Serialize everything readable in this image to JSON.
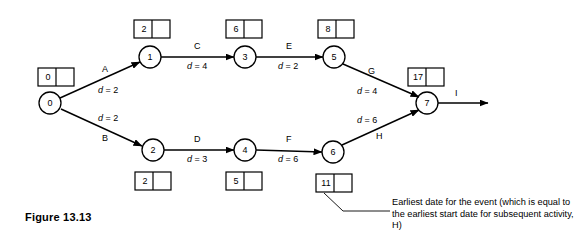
{
  "figure": {
    "caption": "Figure 13.13",
    "annotation": "Earliest date for the event  (which is equal to the earliest start date for subsequent activity, H)"
  },
  "chart_data": {
    "type": "diagram",
    "title": "Figure 13.13",
    "diagram_kind": "activity-on-arrow network / PERT chart",
    "nodes": [
      {
        "id": "0",
        "label": "0",
        "x": 50,
        "y": 103,
        "earliest_date": "0",
        "latest_date": "",
        "box_x": 38,
        "box_y": 68
      },
      {
        "id": "1",
        "label": "1",
        "x": 150,
        "y": 57,
        "earliest_date": "2",
        "latest_date": "",
        "box_x": 134,
        "box_y": 20
      },
      {
        "id": "2",
        "label": "2",
        "x": 153,
        "y": 150,
        "earliest_date": "2",
        "latest_date": "",
        "box_x": 135,
        "box_y": 172
      },
      {
        "id": "3",
        "label": "3",
        "x": 245,
        "y": 57,
        "earliest_date": "6",
        "latest_date": "",
        "box_x": 226,
        "box_y": 20
      },
      {
        "id": "4",
        "label": "4",
        "x": 245,
        "y": 150,
        "earliest_date": "5",
        "latest_date": "",
        "box_x": 226,
        "box_y": 172
      },
      {
        "id": "5",
        "label": "5",
        "x": 334,
        "y": 57,
        "earliest_date": "8",
        "latest_date": "",
        "box_x": 318,
        "box_y": 20
      },
      {
        "id": "6",
        "label": "6",
        "x": 333,
        "y": 152,
        "earliest_date": "11",
        "latest_date": "",
        "box_x": 316,
        "box_y": 174
      },
      {
        "id": "7",
        "label": "7",
        "x": 427,
        "y": 103,
        "earliest_date": "17",
        "latest_date": "",
        "box_x": 408,
        "box_y": 68
      }
    ],
    "edges": [
      {
        "activity": "A",
        "duration": "2",
        "from": "0",
        "to": "1",
        "duration_label": "d = 2"
      },
      {
        "activity": "B",
        "duration": "2",
        "from": "0",
        "to": "2",
        "duration_label": "d = 2"
      },
      {
        "activity": "C",
        "duration": "4",
        "from": "1",
        "to": "3",
        "duration_label": "d = 4"
      },
      {
        "activity": "D",
        "duration": "3",
        "from": "2",
        "to": "4",
        "duration_label": "d = 3"
      },
      {
        "activity": "E",
        "duration": "2",
        "from": "3",
        "to": "5",
        "duration_label": "d = 2"
      },
      {
        "activity": "F",
        "duration": "6",
        "from": "4",
        "to": "6",
        "duration_label": "d = 6"
      },
      {
        "activity": "G",
        "duration": "4",
        "from": "5",
        "to": "7",
        "duration_label": "d = 4"
      },
      {
        "activity": "H",
        "duration": "6",
        "from": "6",
        "to": "7",
        "duration_label": "d = 6"
      },
      {
        "activity": "I",
        "duration": "",
        "from": "7",
        "to": "",
        "duration_label": ""
      }
    ],
    "annotation": {
      "text": "Earliest date for the event  (which is equal to the earliest start date for subsequent activity, H)",
      "points_to_node": "6"
    }
  },
  "labels": {
    "A": "A",
    "B": "B",
    "C": "C",
    "D": "D",
    "E": "E",
    "F": "F",
    "G": "G",
    "H": "H",
    "I": "I",
    "dA": "d = 2",
    "dB": "d = 2",
    "dC": "d = 4",
    "dD": "d = 3",
    "dE": "d = 2",
    "dF": "d = 6",
    "dG": "d = 4",
    "dH": "d = 6"
  },
  "node_values": {
    "n0": "0",
    "n1": "1",
    "n2": "2",
    "n3": "3",
    "n4": "4",
    "n5": "5",
    "n6": "6",
    "n7": "7"
  },
  "box_values": {
    "b0": "0",
    "b1": "2",
    "b2": "2",
    "b3": "6",
    "b4": "5",
    "b5": "8",
    "b6": "11",
    "b7": "17"
  },
  "colors": {
    "stroke": "#000000",
    "background": "#ffffff"
  }
}
